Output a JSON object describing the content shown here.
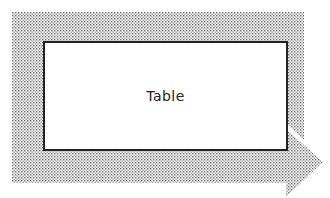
{
  "diagram": {
    "node": {
      "label": "Table"
    },
    "colors": {
      "stipple": "#888888",
      "background": "#ffffff",
      "border": "#222222"
    }
  }
}
